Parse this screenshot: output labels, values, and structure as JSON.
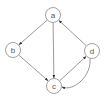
{
  "diagram": {
    "type": "directed-graph",
    "colors": {
      "node_stroke": "#7a7a7a",
      "edge": "#6e6e6e",
      "arrow": "#333333",
      "label": "#555555",
      "background": "#ffffff"
    },
    "nodes": [
      {
        "id": "a",
        "label": "a",
        "cx": 53,
        "cy": 15,
        "r": 7.5
      },
      {
        "id": "b",
        "label": "b",
        "cx": 13,
        "cy": 50,
        "r": 7.5
      },
      {
        "id": "c",
        "label": "c",
        "cx": 54,
        "cy": 86,
        "r": 7.5
      },
      {
        "id": "d",
        "label": "d",
        "cx": 92,
        "cy": 51,
        "r": 7.5
      }
    ],
    "edges": [
      {
        "from": "a",
        "to": "b",
        "curved": false
      },
      {
        "from": "a",
        "to": "c",
        "curved": false
      },
      {
        "from": "b",
        "to": "c",
        "curved": false
      },
      {
        "from": "d",
        "to": "a",
        "curved": false
      },
      {
        "from": "c",
        "to": "d",
        "curved": false
      },
      {
        "from": "d",
        "to": "c",
        "curved": true
      }
    ]
  }
}
